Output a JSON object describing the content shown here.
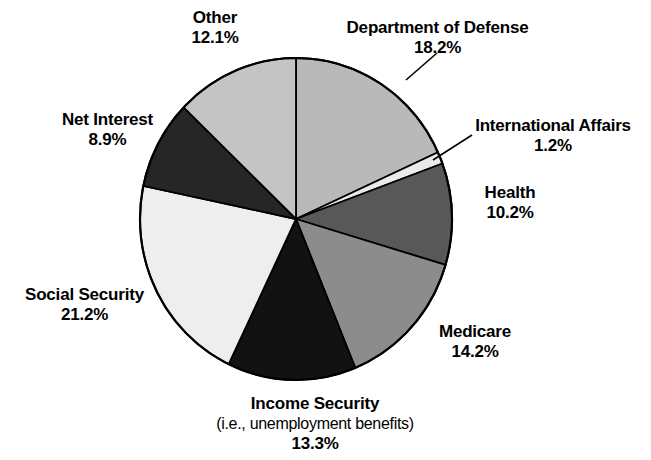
{
  "chart_data": {
    "type": "pie",
    "title": "",
    "subtitle": "",
    "xlabel": "",
    "ylabel": "",
    "legend_position": "none",
    "grid": false,
    "units": "percent",
    "start_angle_deg": 0,
    "direction": "clockwise",
    "total": 99.3,
    "categories": [
      "Department of Defense",
      "International Affairs",
      "Health",
      "Medicare",
      "Income Security",
      "Social Security",
      "Net Interest",
      "Other"
    ],
    "values": [
      18.2,
      1.2,
      10.2,
      14.2,
      13.3,
      21.2,
      8.9,
      12.1
    ],
    "slices": [
      {
        "label": "Department of Defense",
        "value": 18.2,
        "pct_text": "18.2%",
        "color": "#b9b9b9",
        "start_deg": 0.0,
        "end_deg": 65.52,
        "has_leader_line": true
      },
      {
        "label": "International Affairs",
        "value": 1.2,
        "pct_text": "1.2%",
        "color": "#eaeaea",
        "start_deg": 65.52,
        "end_deg": 69.84,
        "has_leader_line": true
      },
      {
        "label": "Health",
        "value": 10.2,
        "pct_text": "10.2%",
        "color": "#585858",
        "start_deg": 69.84,
        "end_deg": 106.56,
        "has_leader_line": false
      },
      {
        "label": "Medicare",
        "value": 14.2,
        "pct_text": "14.2%",
        "color": "#8c8c8c",
        "start_deg": 106.56,
        "end_deg": 157.68,
        "has_leader_line": false
      },
      {
        "label": "Income Security",
        "value": 13.3,
        "pct_text": "13.3%",
        "sub_text": "(i.e., unemployment benefits)",
        "color": "#121212",
        "start_deg": 157.68,
        "end_deg": 205.56,
        "has_leader_line": false
      },
      {
        "label": "Social Security",
        "value": 21.2,
        "pct_text": "21.2%",
        "color": "#eeeeee",
        "start_deg": 205.56,
        "end_deg": 281.88,
        "has_leader_line": false
      },
      {
        "label": "Net Interest",
        "value": 8.9,
        "pct_text": "8.9%",
        "color": "#262626",
        "start_deg": 281.88,
        "end_deg": 313.92,
        "has_leader_line": false
      },
      {
        "label": "Other",
        "value": 12.1,
        "pct_text": "12.1%",
        "color": "#c4c4c4",
        "start_deg": 313.92,
        "end_deg": 360.0,
        "has_leader_line": false
      }
    ]
  },
  "labels": {
    "other": {
      "name": "Other",
      "pct": "12.1%"
    },
    "department_of_defense": {
      "name": "Department of Defense",
      "pct": "18.2%"
    },
    "international_affairs": {
      "name": "International Affairs",
      "pct": "1.2%"
    },
    "health": {
      "name": "Health",
      "pct": "10.2%"
    },
    "medicare": {
      "name": "Medicare",
      "pct": "14.2%"
    },
    "net_interest": {
      "name": "Net Interest",
      "pct": "8.9%"
    },
    "social_security": {
      "name": "Social Security",
      "pct": "21.2%"
    },
    "income_security": {
      "name": "Income Security",
      "sub": "(i.e., unemployment benefits)",
      "pct": "13.3%"
    }
  },
  "geometry": {
    "center_x": 296,
    "center_y": 219,
    "radius_x": 156,
    "radius_y": 161,
    "outline_color": "#000000",
    "outline_width": 2.2,
    "background": "#ffffff"
  }
}
